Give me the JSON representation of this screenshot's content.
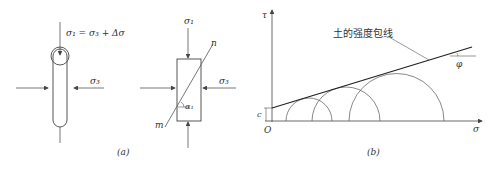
{
  "figure_a": {
    "caption": "(a)",
    "specimen_label_top": "σ₁ = σ₃ + Δσ",
    "specimen_label_side": "σ₃",
    "element_label_top": "σ₁",
    "element_label_side": "σ₃",
    "plane_label_n": "n",
    "plane_label_m": "m",
    "angle_label": "α₁"
  },
  "figure_b": {
    "caption": "(b)",
    "axis_y_label": "τ",
    "axis_x_label": "σ",
    "origin_label": "O",
    "intercept_label": "c",
    "angle_label": "φ",
    "envelope_label": "土的强度包线"
  },
  "colors": {
    "line": "#444444",
    "envelope": "#222222",
    "text": "#333333"
  }
}
